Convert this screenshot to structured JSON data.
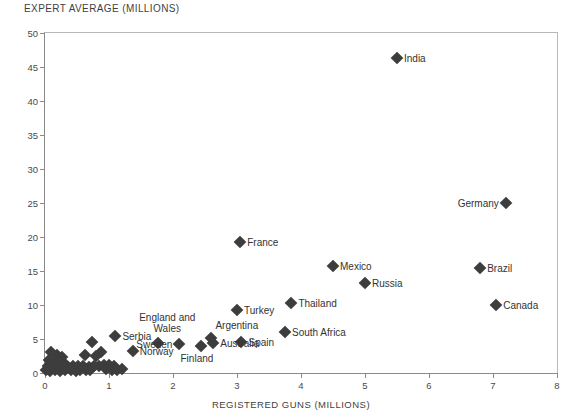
{
  "chart_data": {
    "type": "scatter",
    "title": "EXPERT AVERAGE (MILLIONS)",
    "xlabel": "REGISTERED GUNS (MILLIONS)",
    "ylabel": "EXPERT AVERAGE (MILLIONS)",
    "xlim": [
      0,
      8
    ],
    "ylim": [
      0,
      50
    ],
    "xticks": [
      0,
      1,
      2,
      3,
      4,
      5,
      6,
      7,
      8
    ],
    "yticks": [
      0,
      5,
      10,
      15,
      20,
      25,
      30,
      35,
      40,
      45,
      50
    ],
    "grid": false,
    "legend": "none",
    "marker": "diamond",
    "marker_color": "#3d3d3d",
    "points": [
      {
        "label": "India",
        "x": 5.5,
        "y": 46.3,
        "label_pos": "right"
      },
      {
        "label": "Germany",
        "x": 7.2,
        "y": 25.0,
        "label_pos": "left"
      },
      {
        "label": "France",
        "x": 3.05,
        "y": 19.2,
        "label_pos": "right"
      },
      {
        "label": "Mexico",
        "x": 4.5,
        "y": 15.7,
        "label_pos": "right"
      },
      {
        "label": "Brazil",
        "x": 6.8,
        "y": 15.4,
        "label_pos": "right"
      },
      {
        "label": "Russia",
        "x": 5.0,
        "y": 13.2,
        "label_pos": "right"
      },
      {
        "label": "Thailand",
        "x": 3.85,
        "y": 10.3,
        "label_pos": "right"
      },
      {
        "label": "Canada",
        "x": 7.05,
        "y": 10.0,
        "label_pos": "right"
      },
      {
        "label": "Turkey",
        "x": 3.0,
        "y": 9.3,
        "label_pos": "right"
      },
      {
        "label": "South Africa",
        "x": 3.75,
        "y": 6.1,
        "label_pos": "right"
      },
      {
        "label": "Argentina",
        "x": 2.6,
        "y": 5.2,
        "label_pos": "above"
      },
      {
        "label": "England and Wales",
        "x": 1.77,
        "y": 4.4,
        "label_pos": "above"
      },
      {
        "label": "Spain",
        "x": 3.07,
        "y": 4.6,
        "label_pos": "right"
      },
      {
        "label": "Australia",
        "x": 2.63,
        "y": 4.4,
        "label_pos": "right"
      },
      {
        "label": "Sweden",
        "x": 2.1,
        "y": 4.3,
        "label_pos": "left"
      },
      {
        "label": "Serbia",
        "x": 1.1,
        "y": 5.5,
        "label_pos": "right"
      },
      {
        "label": "Finland",
        "x": 2.43,
        "y": 4.0,
        "label_pos": "below"
      },
      {
        "label": "Norway",
        "x": 1.37,
        "y": 3.2,
        "label_pos": "right"
      },
      {
        "label": "",
        "x": 0.73,
        "y": 4.5,
        "label_pos": "none"
      },
      {
        "label": "",
        "x": 0.8,
        "y": 2.5,
        "label_pos": "none"
      },
      {
        "label": "",
        "x": 0.88,
        "y": 3.1,
        "label_pos": "none"
      },
      {
        "label": "",
        "x": 0.62,
        "y": 2.7,
        "label_pos": "none"
      },
      {
        "label": "",
        "x": 0.1,
        "y": 3.1,
        "label_pos": "none"
      },
      {
        "label": "",
        "x": 0.18,
        "y": 2.6,
        "label_pos": "none"
      },
      {
        "label": "",
        "x": 0.26,
        "y": 2.3,
        "label_pos": "none"
      },
      {
        "label": "",
        "x": 0.06,
        "y": 1.9,
        "label_pos": "none"
      },
      {
        "label": "",
        "x": 0.14,
        "y": 1.6,
        "label_pos": "none"
      },
      {
        "label": "",
        "x": 0.22,
        "y": 1.4,
        "label_pos": "none"
      },
      {
        "label": "",
        "x": 0.3,
        "y": 1.5,
        "label_pos": "none"
      },
      {
        "label": "",
        "x": 0.05,
        "y": 1.1,
        "label_pos": "none"
      },
      {
        "label": "",
        "x": 0.12,
        "y": 0.9,
        "label_pos": "none"
      },
      {
        "label": "",
        "x": 0.2,
        "y": 0.8,
        "label_pos": "none"
      },
      {
        "label": "",
        "x": 0.28,
        "y": 0.7,
        "label_pos": "none"
      },
      {
        "label": "",
        "x": 0.36,
        "y": 0.9,
        "label_pos": "none"
      },
      {
        "label": "",
        "x": 0.44,
        "y": 1.0,
        "label_pos": "none"
      },
      {
        "label": "",
        "x": 0.52,
        "y": 1.1,
        "label_pos": "none"
      },
      {
        "label": "",
        "x": 0.6,
        "y": 1.0,
        "label_pos": "none"
      },
      {
        "label": "",
        "x": 0.68,
        "y": 0.9,
        "label_pos": "none"
      },
      {
        "label": "",
        "x": 0.76,
        "y": 1.0,
        "label_pos": "none"
      },
      {
        "label": "",
        "x": 0.84,
        "y": 1.1,
        "label_pos": "none"
      },
      {
        "label": "",
        "x": 0.92,
        "y": 1.2,
        "label_pos": "none"
      },
      {
        "label": "",
        "x": 1.0,
        "y": 1.2,
        "label_pos": "none"
      },
      {
        "label": "",
        "x": 1.08,
        "y": 1.1,
        "label_pos": "none"
      },
      {
        "label": "",
        "x": 0.4,
        "y": 0.4,
        "label_pos": "none"
      },
      {
        "label": "",
        "x": 0.55,
        "y": 0.5,
        "label_pos": "none"
      },
      {
        "label": "",
        "x": 0.7,
        "y": 0.5,
        "label_pos": "none"
      },
      {
        "label": "",
        "x": 0.02,
        "y": 0.5,
        "label_pos": "none"
      },
      {
        "label": "",
        "x": 0.08,
        "y": 0.3,
        "label_pos": "none"
      },
      {
        "label": "",
        "x": 0.16,
        "y": 0.4,
        "label_pos": "none"
      },
      {
        "label": "",
        "x": 0.24,
        "y": 0.3,
        "label_pos": "none"
      },
      {
        "label": "",
        "x": 0.32,
        "y": 0.4,
        "label_pos": "none"
      },
      {
        "label": "",
        "x": 0.48,
        "y": 0.3,
        "label_pos": "none"
      },
      {
        "label": "",
        "x": 0.64,
        "y": 0.4,
        "label_pos": "none"
      },
      {
        "label": "",
        "x": 0.96,
        "y": 0.6,
        "label_pos": "none"
      },
      {
        "label": "",
        "x": 1.04,
        "y": 0.5,
        "label_pos": "none"
      },
      {
        "label": "",
        "x": 1.12,
        "y": 0.5,
        "label_pos": "none"
      },
      {
        "label": "",
        "x": 1.2,
        "y": 0.6,
        "label_pos": "none"
      }
    ]
  }
}
